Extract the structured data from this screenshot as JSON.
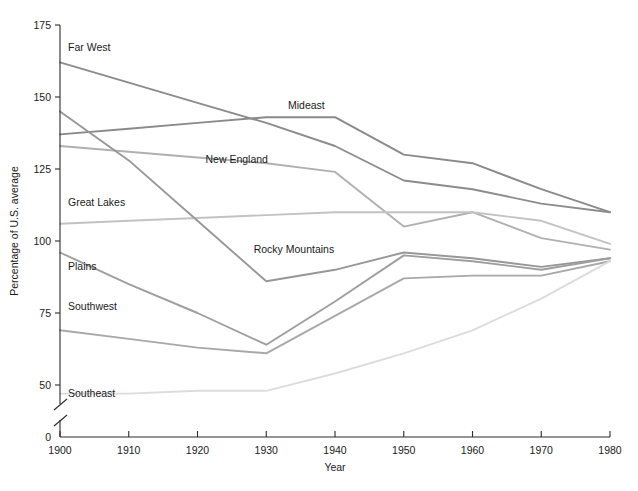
{
  "chart_data": {
    "type": "line",
    "title": "",
    "xlabel": "Year",
    "ylabel": "Percentage of U.S. average",
    "x": [
      1900,
      1910,
      1920,
      1930,
      1940,
      1950,
      1960,
      1970,
      1980
    ],
    "xlim": [
      1900,
      1980
    ],
    "ylim": [
      50,
      175
    ],
    "y_axis_break": true,
    "y_axis_break_note": "axis broken between 0 and 50",
    "xticks": [
      "1900",
      "1910",
      "1920",
      "1930",
      "1940",
      "1950",
      "1960",
      "1970",
      "1980"
    ],
    "yticks": [
      "0",
      "50",
      "75",
      "100",
      "125",
      "150",
      "175"
    ],
    "grid": false,
    "legend": "inline-labels",
    "series": [
      {
        "name": "Far West",
        "color": "#8c8c8c",
        "values": [
          162,
          155,
          148,
          141,
          133,
          121,
          118,
          113,
          110
        ],
        "label_x": 1900,
        "label_y": 166
      },
      {
        "name": "Mideast",
        "color": "#8a8a8a",
        "values": [
          137,
          139,
          141,
          143,
          143,
          130,
          127,
          118,
          110
        ],
        "label_x": 1932,
        "label_y": 146
      },
      {
        "name": "New England",
        "color": "#b0b0b0",
        "values": [
          133,
          131,
          129,
          127,
          124,
          105,
          110,
          101,
          97
        ],
        "label_x": 1920,
        "label_y": 127
      },
      {
        "name": "Great Lakes",
        "color": "#c2c2c2",
        "values": [
          106,
          107,
          108,
          109,
          110,
          110,
          110,
          107,
          99
        ],
        "label_x": 1900,
        "label_y": 112
      },
      {
        "name": "Rocky Mountains",
        "color": "#979797",
        "values": [
          145,
          128,
          107,
          86,
          90,
          96,
          94,
          91,
          94
        ],
        "label_x": 1927,
        "label_y": 96
      },
      {
        "name": "Plains",
        "color": "#9e9e9e",
        "values": [
          96,
          85,
          75,
          64,
          79,
          95,
          93,
          90,
          94
        ],
        "label_x": 1900,
        "label_y": 90
      },
      {
        "name": "Southwest",
        "color": "#a8a8a8",
        "values": [
          69,
          66,
          63,
          61,
          74,
          87,
          88,
          88,
          93
        ],
        "label_x": 1900,
        "label_y": 76
      },
      {
        "name": "Southeast",
        "color": "#dcdcdc",
        "values": [
          47,
          47,
          48,
          48,
          54,
          61,
          69,
          80,
          93
        ],
        "label_x": 1900,
        "label_y": 46
      }
    ]
  },
  "axis": {
    "y_label": "Percentage of U.S. average",
    "x_label": "Year",
    "x_ticks": [
      "1900",
      "1910",
      "1920",
      "1930",
      "1940",
      "1950",
      "1960",
      "1970",
      "1980"
    ],
    "y_ticks": [
      "175",
      "150",
      "125",
      "100",
      "75",
      "50",
      "0"
    ]
  }
}
